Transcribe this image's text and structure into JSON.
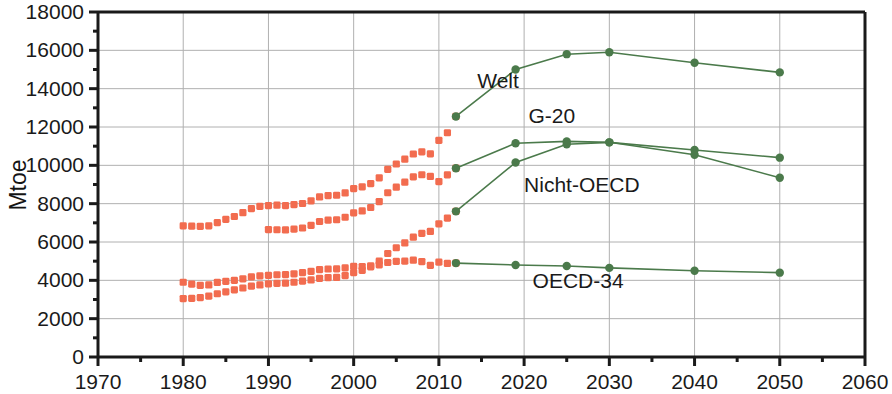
{
  "chart_data": {
    "type": "line",
    "title": "",
    "xlabel": "",
    "ylabel": "Mtoe",
    "xlim": [
      1970,
      2060
    ],
    "ylim": [
      0,
      18000
    ],
    "grid": true,
    "legend_position": "inline-annotations",
    "x_ticks": [
      1970,
      1980,
      1990,
      2000,
      2010,
      2020,
      2030,
      2040,
      2050,
      2060
    ],
    "y_ticks": [
      0,
      2000,
      4000,
      6000,
      8000,
      10000,
      12000,
      14000,
      16000,
      18000
    ],
    "y_minor_ticks": [
      1000,
      3000,
      5000,
      7000,
      9000,
      11000,
      13000,
      15000,
      17000
    ],
    "colors": {
      "historical": "#F26C4F",
      "projection": "#4B7A4B",
      "grid": "#B0B0B0",
      "axis": "#1a1a1a"
    },
    "annotations": [
      {
        "label": "Welt",
        "x": 2014.5,
        "y": 14050
      },
      {
        "label": "G-20",
        "x": 2020.5,
        "y": 12200
      },
      {
        "label": "Nicht-OECD",
        "x": 2020.0,
        "y": 8600
      },
      {
        "label": "OECD-34",
        "x": 2021.0,
        "y": 3600
      },
      {
        "label": "Mtoe",
        "x": 0,
        "y": 0
      }
    ],
    "series": [
      {
        "name": "Welt",
        "phase": "historical",
        "color": "#F26C4F",
        "x": [
          1980,
          1981,
          1982,
          1983,
          1984,
          1985,
          1986,
          1987,
          1988,
          1989,
          1990,
          1991,
          1992,
          1993,
          1994,
          1995,
          1996,
          1997,
          1998,
          1999,
          2000,
          2001,
          2002,
          2003,
          2004,
          2005,
          2006,
          2007,
          2008,
          2009,
          2010,
          2011,
          2012
        ],
        "values": [
          6840,
          6830,
          6820,
          6840,
          7010,
          7180,
          7330,
          7530,
          7740,
          7860,
          7900,
          7920,
          7900,
          7950,
          8010,
          8150,
          8350,
          8420,
          8440,
          8560,
          8790,
          8880,
          9050,
          9350,
          9790,
          10070,
          10320,
          10590,
          10700,
          10600,
          11300,
          11700,
          12550
        ]
      },
      {
        "name": "Welt",
        "phase": "projection",
        "color": "#4B7A4B",
        "x": [
          2012,
          2019,
          2025,
          2030,
          2040,
          2050
        ],
        "values": [
          12550,
          15000,
          15800,
          15900,
          15350,
          14850
        ]
      },
      {
        "name": "G-20",
        "phase": "historical",
        "color": "#F26C4F",
        "x": [
          1990,
          1991,
          1992,
          1993,
          1994,
          1995,
          1996,
          1997,
          1998,
          1999,
          2000,
          2001,
          2002,
          2003,
          2004,
          2005,
          2006,
          2007,
          2008,
          2009,
          2010,
          2011,
          2012
        ],
        "values": [
          6650,
          6640,
          6630,
          6670,
          6730,
          6870,
          7070,
          7140,
          7160,
          7290,
          7520,
          7620,
          7800,
          8110,
          8570,
          8860,
          9120,
          9400,
          9510,
          9420,
          9150,
          9500,
          9850
        ]
      },
      {
        "name": "G-20",
        "phase": "projection",
        "color": "#4B7A4B",
        "x": [
          2012,
          2019,
          2025,
          2030,
          2040,
          2050
        ],
        "values": [
          9850,
          11150,
          11250,
          11200,
          10800,
          10400
        ]
      },
      {
        "name": "Nicht-OECD",
        "phase": "historical",
        "color": "#F26C4F",
        "x": [
          1980,
          1981,
          1982,
          1983,
          1984,
          1985,
          1986,
          1987,
          1988,
          1989,
          1990,
          1991,
          1992,
          1993,
          1994,
          1995,
          1996,
          1997,
          1998,
          1999,
          2000,
          2001,
          2002,
          2003,
          2004,
          2005,
          2006,
          2007,
          2008,
          2009,
          2010,
          2011,
          2012
        ],
        "values": [
          3050,
          3060,
          3100,
          3180,
          3300,
          3400,
          3500,
          3600,
          3700,
          3760,
          3820,
          3840,
          3850,
          3900,
          3960,
          4020,
          4100,
          4140,
          4150,
          4250,
          4400,
          4520,
          4700,
          5000,
          5400,
          5700,
          5950,
          6250,
          6450,
          6550,
          6950,
          7250,
          7600
        ]
      },
      {
        "name": "Nicht-OECD",
        "phase": "projection",
        "color": "#4B7A4B",
        "x": [
          2012,
          2019,
          2025,
          2030,
          2040,
          2050
        ],
        "values": [
          7600,
          10150,
          11100,
          11200,
          10550,
          9350
        ]
      },
      {
        "name": "OECD-34",
        "phase": "historical",
        "color": "#F26C4F",
        "x": [
          1980,
          1981,
          1982,
          1983,
          1984,
          1985,
          1986,
          1987,
          1988,
          1989,
          1990,
          1991,
          1992,
          1993,
          1994,
          1995,
          1996,
          1997,
          1998,
          1999,
          2000,
          2001,
          2002,
          2003,
          2004,
          2005,
          2006,
          2007,
          2008,
          2009,
          2010,
          2011,
          2012
        ],
        "values": [
          3900,
          3800,
          3740,
          3760,
          3890,
          3950,
          4000,
          4080,
          4180,
          4230,
          4260,
          4290,
          4300,
          4340,
          4400,
          4470,
          4560,
          4590,
          4600,
          4650,
          4730,
          4720,
          4760,
          4810,
          4930,
          4990,
          5000,
          5050,
          4980,
          4780,
          4950,
          4880,
          4900
        ]
      },
      {
        "name": "OECD-34",
        "phase": "projection",
        "color": "#4B7A4B",
        "x": [
          2012,
          2019,
          2025,
          2030,
          2040,
          2050
        ],
        "values": [
          4900,
          4800,
          4750,
          4650,
          4500,
          4400
        ]
      }
    ]
  },
  "axis": {
    "y_label": "Mtoe"
  },
  "labels": {
    "welt": "Welt",
    "g20": "G-20",
    "nicht_oecd": "Nicht-OECD",
    "oecd34": "OECD-34"
  }
}
